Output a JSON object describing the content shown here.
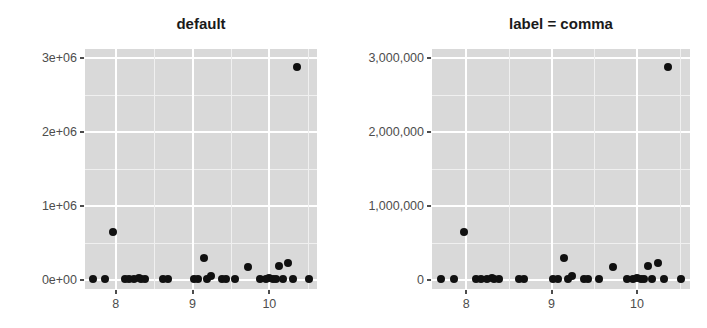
{
  "figure": {
    "background_color": "#ffffff",
    "panel_background_color": "#d9d9d9",
    "gridline_color": "#ffffff",
    "point_color": "#101010",
    "axis_text_color": "#4d4d4d",
    "title_color": "#1a1a1a"
  },
  "chart_data": [
    {
      "type": "scatter",
      "title": "default",
      "xlabel": "",
      "ylabel": "",
      "xlim": [
        7.6,
        10.62
      ],
      "ylim": [
        -120000,
        3120000
      ],
      "grid": true,
      "legend": "none",
      "xticks": [
        8,
        9,
        10
      ],
      "xtick_labels": [
        "8",
        "9",
        "10"
      ],
      "yticks": [
        0,
        1000000,
        2000000,
        3000000
      ],
      "ytick_labels": [
        "0e+00",
        "1e+06",
        "2e+06",
        "3e+06"
      ],
      "x": [
        7.7,
        7.86,
        7.97,
        8.12,
        8.17,
        8.24,
        8.3,
        8.33,
        8.38,
        8.62,
        8.68,
        9.02,
        9.07,
        9.15,
        9.19,
        9.24,
        9.38,
        9.43,
        9.55,
        9.72,
        9.88,
        9.95,
        10.0,
        10.05,
        10.08,
        10.13,
        10.18,
        10.24,
        10.31,
        10.36,
        10.52
      ],
      "y": [
        10000,
        20000,
        650000,
        15000,
        20000,
        10000,
        25000,
        15000,
        20000,
        10000,
        20000,
        15000,
        20000,
        300000,
        10000,
        60000,
        15000,
        20000,
        10000,
        175000,
        20000,
        15000,
        25000,
        10000,
        20000,
        190000,
        15000,
        230000,
        20000,
        2880000,
        15000
      ]
    },
    {
      "type": "scatter",
      "title": "label = comma",
      "xlabel": "",
      "ylabel": "",
      "xlim": [
        7.6,
        10.62
      ],
      "ylim": [
        -120000,
        3120000
      ],
      "grid": true,
      "legend": "none",
      "xticks": [
        8,
        9,
        10
      ],
      "xtick_labels": [
        "8",
        "9",
        "10"
      ],
      "yticks": [
        0,
        1000000,
        2000000,
        3000000
      ],
      "ytick_labels": [
        "0",
        "1,000,000",
        "2,000,000",
        "3,000,000"
      ],
      "x": [
        7.7,
        7.86,
        7.97,
        8.12,
        8.17,
        8.24,
        8.3,
        8.33,
        8.38,
        8.62,
        8.68,
        9.02,
        9.07,
        9.15,
        9.19,
        9.24,
        9.38,
        9.43,
        9.55,
        9.72,
        9.88,
        9.95,
        10.0,
        10.05,
        10.08,
        10.13,
        10.18,
        10.24,
        10.31,
        10.36,
        10.52
      ],
      "y": [
        10000,
        20000,
        650000,
        15000,
        20000,
        10000,
        25000,
        15000,
        20000,
        10000,
        20000,
        15000,
        20000,
        300000,
        10000,
        60000,
        15000,
        20000,
        10000,
        175000,
        20000,
        15000,
        25000,
        10000,
        20000,
        190000,
        15000,
        230000,
        20000,
        2880000,
        15000
      ]
    }
  ]
}
